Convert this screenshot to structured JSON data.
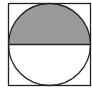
{
  "diagram": {
    "square": {
      "x": 8.5,
      "y": 3.5,
      "size": 82,
      "stroke": "#222222",
      "fill": "#ffffff"
    },
    "circle": {
      "cx": 49.5,
      "cy": 44.5,
      "r": 41,
      "stroke": "#222222"
    },
    "diameter": {
      "y": 44.5,
      "stroke": "#222222"
    },
    "shaded_region": {
      "part": "upper semicircle",
      "fill": "#9a9a9a"
    }
  }
}
